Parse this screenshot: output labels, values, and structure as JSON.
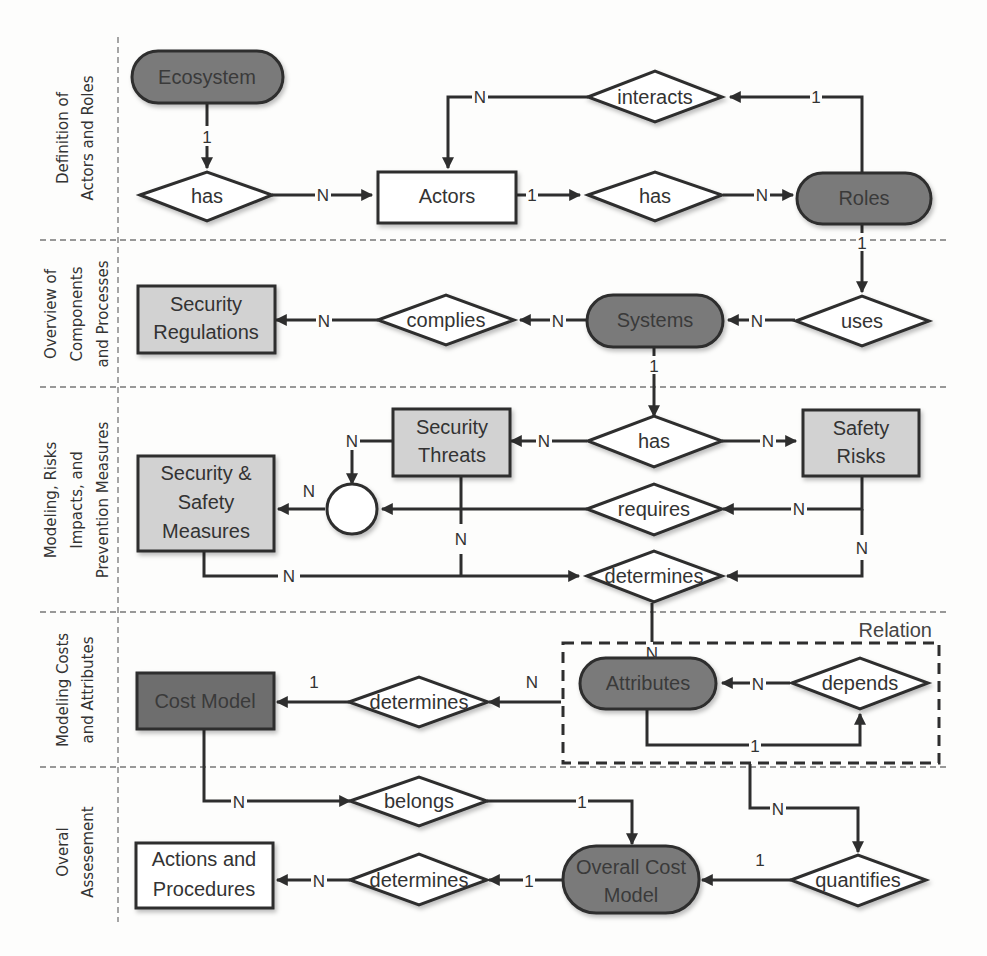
{
  "lanes": [
    {
      "id": "actors-roles",
      "lines": [
        "Definition of",
        "Actors and Roles"
      ]
    },
    {
      "id": "components",
      "lines": [
        "Overview of",
        "Components",
        "and Processes"
      ]
    },
    {
      "id": "risks",
      "lines": [
        "Modeling, Risks",
        "Impacts, and",
        "Prevention Measures"
      ]
    },
    {
      "id": "costs",
      "lines": [
        "Modeling Costs",
        "and Attributes"
      ]
    },
    {
      "id": "assessment",
      "lines": [
        "Overal",
        "Assesement"
      ]
    }
  ],
  "entities": {
    "ecosystem": {
      "label": "Ecosystem",
      "style": "dark-rounded"
    },
    "actors": {
      "label": "Actors",
      "style": "white-rect"
    },
    "roles": {
      "label": "Roles",
      "style": "dark-rounded"
    },
    "security_regulations": {
      "lines": [
        "Security",
        "Regulations"
      ],
      "style": "light-rect"
    },
    "systems": {
      "label": "Systems",
      "style": "dark-rounded"
    },
    "security_threats": {
      "lines": [
        "Security",
        "Threats"
      ],
      "style": "light-rect"
    },
    "safety_risks": {
      "lines": [
        "Safety",
        "Risks"
      ],
      "style": "light-rect"
    },
    "security_safety_measures": {
      "lines": [
        "Security &",
        "Safety",
        "Measures"
      ],
      "style": "light-rect"
    },
    "attributes": {
      "label": "Attributes",
      "style": "dark-rounded"
    },
    "cost_model": {
      "label": "Cost Model",
      "style": "dark-rect"
    },
    "overall_cost_model": {
      "lines": [
        "Overall Cost",
        "Model"
      ],
      "style": "dark-rounded"
    },
    "actions_procedures": {
      "lines": [
        "Actions and",
        "Procedures"
      ],
      "style": "white-rect"
    }
  },
  "relationships": {
    "eco_has": "has",
    "interacts": "interacts",
    "actors_has": "has",
    "uses": "uses",
    "complies": "complies",
    "systems_has": "has",
    "requires": "requires",
    "risk_determines": "determines",
    "depends": "depends",
    "cost_determines": "determines",
    "belongs": "belongs",
    "action_determines": "determines",
    "quantifies": "quantifies"
  },
  "group": {
    "label": "Relation"
  },
  "cardinalities": {
    "eco_to_has": "1",
    "has_to_actors": "N",
    "interacts_to_actors": "N",
    "roles_to_interacts": "1",
    "actors_to_has": "1",
    "has_to_roles": "N",
    "roles_to_uses": "1",
    "uses_to_systems": "N",
    "systems_to_complies": "N",
    "complies_to_regulations": "N",
    "systems_to_has": "1",
    "has_to_threats": "N",
    "has_to_risks": "N",
    "threats_to_circle": "N",
    "circle_to_measures": "N",
    "risks_to_requires": "N",
    "threats_to_determines": "N",
    "measures_to_determines": "N",
    "risks_to_determines": "N",
    "determines_to_attributes": "N",
    "depends_to_attributes": "N",
    "attributes_to_depends": "1",
    "attributes_to_determines": "N",
    "determines_to_costmodel": "1",
    "costmodel_to_belongs": "N",
    "belongs_to_overall": "1",
    "attributes_to_quantifies": "N",
    "quantifies_to_overall": "1",
    "overall_to_determines": "1",
    "determines_to_actions": "N"
  },
  "colors": {
    "dark_fill": "#7a7a7a",
    "light_fill": "#d2d2d2",
    "stroke": "#2e2e2e",
    "lane_divider": "#777777"
  }
}
